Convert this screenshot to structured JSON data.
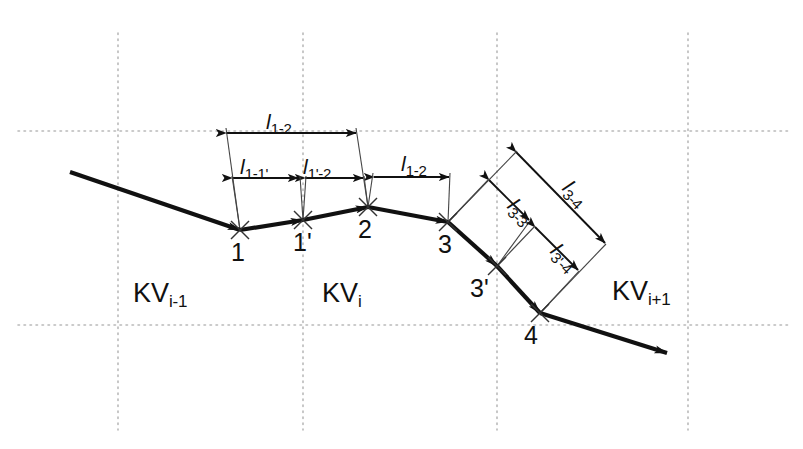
{
  "figure": {
    "background": "#ffffff",
    "stroke_color": "#111111",
    "grid_color": "#b9b9b9",
    "width": 803,
    "height": 449
  },
  "grid": {
    "vertical_x": [
      118,
      303,
      497,
      688
    ],
    "vertical_y_start": 33,
    "vertical_y_end": 430,
    "horizontal_y": [
      131,
      325
    ],
    "horizontal_x_start": 18,
    "horizontal_x_end": 790,
    "style": "dotted"
  },
  "zones": [
    {
      "name": "kv-left",
      "label_main": "KV",
      "label_sub": "i-1",
      "x": 133,
      "y": 278
    },
    {
      "name": "kv-center",
      "label_main": "KV",
      "label_sub": "i",
      "x": 322,
      "y": 278
    },
    {
      "name": "kv-right",
      "label_main": "KV",
      "label_sub": "i+1",
      "x": 612,
      "y": 276
    }
  ],
  "nodes": [
    {
      "id": "1",
      "label": "1",
      "x": 240,
      "y": 230,
      "label_x": 231,
      "label_y": 238
    },
    {
      "id": "1p",
      "label": "1'",
      "x": 303,
      "y": 220,
      "label_x": 293,
      "label_y": 228
    },
    {
      "id": "2",
      "label": "2",
      "x": 368,
      "y": 207,
      "label_x": 358,
      "label_y": 215
    },
    {
      "id": "3",
      "label": "3",
      "x": 448,
      "y": 222,
      "label_x": 438,
      "label_y": 230
    },
    {
      "id": "3p",
      "label": "3'",
      "x": 497,
      "y": 266,
      "label_x": 470,
      "label_y": 274
    },
    {
      "id": "4",
      "label": "4",
      "x": 540,
      "y": 313,
      "label_x": 524,
      "label_y": 321
    }
  ],
  "polyline": {
    "entry_start": {
      "x": 70,
      "y": 172
    },
    "exit_end": {
      "x": 667,
      "y": 353
    },
    "points": [
      {
        "x": 70,
        "y": 172
      },
      {
        "x": 240,
        "y": 230
      },
      {
        "x": 303,
        "y": 220
      },
      {
        "x": 368,
        "y": 207
      },
      {
        "x": 448,
        "y": 222
      },
      {
        "x": 497,
        "y": 266
      },
      {
        "x": 540,
        "y": 313
      },
      {
        "x": 667,
        "y": 353
      }
    ],
    "arrow_at": [
      "1",
      "2",
      "3",
      "4",
      "exit"
    ]
  },
  "dimensions": [
    {
      "name": "l-1-2-upper",
      "label_main": "l",
      "label_sub": "1-2",
      "from": {
        "x": 226,
        "y": 133
      },
      "to": {
        "x": 356,
        "y": 133
      },
      "label_x": 266,
      "label_y": 110,
      "rotation": 0,
      "extension_from": {
        "x": 240,
        "y": 230
      },
      "extension_to": {
        "x": 368,
        "y": 207
      }
    },
    {
      "name": "l-1-1p",
      "label_main": "l",
      "label_sub": "1-1'",
      "from": {
        "x": 232,
        "y": 178
      },
      "to": {
        "x": 298,
        "y": 178
      },
      "label_x": 240,
      "label_y": 155,
      "rotation": 0
    },
    {
      "name": "l-1p-2",
      "label_main": "l",
      "label_sub": "1'-2",
      "from": {
        "x": 305,
        "y": 178
      },
      "to": {
        "x": 363,
        "y": 178
      },
      "label_x": 303,
      "label_y": 155,
      "rotation": 0
    },
    {
      "name": "l-2-3",
      "label_main": "l",
      "label_sub": "1-2",
      "from": {
        "x": 374,
        "y": 177
      },
      "to": {
        "x": 449,
        "y": 177
      },
      "label_x": 401,
      "label_y": 152,
      "rotation": 0,
      "extension_from": {
        "x": 368,
        "y": 207
      },
      "extension_to": {
        "x": 448,
        "y": 222
      }
    },
    {
      "name": "l-3-4",
      "label_main": "l",
      "label_sub": "3-4",
      "from": {
        "x": 516,
        "y": 152
      },
      "to": {
        "x": 605,
        "y": 243
      },
      "label_x": 556,
      "label_y": 168,
      "rotation": 45
    },
    {
      "name": "l-3-3p",
      "label_main": "l",
      "label_sub": "3-3'",
      "from": {
        "x": 489,
        "y": 180
      },
      "to": {
        "x": 529,
        "y": 220
      },
      "label_x": 501,
      "label_y": 186,
      "rotation": 45
    },
    {
      "name": "l-3p-4",
      "label_main": "l",
      "label_sub": "3'-4",
      "from": {
        "x": 535,
        "y": 227
      },
      "to": {
        "x": 578,
        "y": 270
      },
      "label_x": 544,
      "label_y": 231,
      "rotation": 45
    }
  ]
}
